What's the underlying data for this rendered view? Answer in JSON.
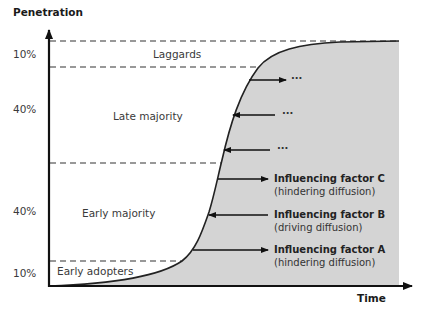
{
  "diagram": {
    "type": "diffusion-s-curve",
    "y_axis": {
      "title": "Penetration"
    },
    "x_axis": {
      "title": "Time"
    },
    "y_labels": [
      "10%",
      "40%",
      "40%",
      "10%"
    ],
    "segments": [
      {
        "label": "Laggards",
        "share": "10%"
      },
      {
        "label": "Late majority",
        "share": "40%"
      },
      {
        "label": "Early majority",
        "share": "40%"
      },
      {
        "label": "Early adopters",
        "share": "10%"
      }
    ],
    "factors": [
      {
        "name": "Influencing factor C",
        "effect": "(hindering diffusion)",
        "direction": "right"
      },
      {
        "name": "Influencing factor B",
        "effect": "(driving diffusion)",
        "direction": "left"
      },
      {
        "name": "Influencing factor A",
        "effect": "(hindering diffusion)",
        "direction": "right"
      }
    ],
    "more_factors": [
      {
        "label": "...",
        "direction": "right"
      },
      {
        "label": "...",
        "direction": "left"
      },
      {
        "label": "...",
        "direction": "left"
      }
    ],
    "colors": {
      "fill": "#d4d4d4",
      "axis": "#111111",
      "curve": "#222222",
      "dash": "#333333",
      "text": "#333333"
    }
  }
}
